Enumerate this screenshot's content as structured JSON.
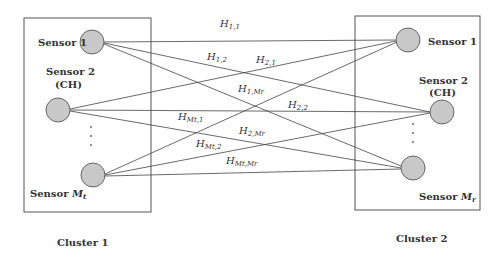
{
  "clusters": [
    {
      "label": "Cluster 1",
      "sensors": [
        {
          "name": "Sensor 1",
          "role": ""
        },
        {
          "name": "Sensor 2",
          "role": "(CH)"
        },
        {
          "name": "Sensor ",
          "index_symbol": "M",
          "index_sub": "t"
        }
      ]
    },
    {
      "label": "Cluster 2",
      "sensors": [
        {
          "name": "Sensor 1",
          "role": ""
        },
        {
          "name": "Sensor 2",
          "role": "(CH)"
        },
        {
          "name": "Sensor ",
          "index_symbol": "M",
          "index_sub": "r"
        }
      ]
    }
  ],
  "channels": [
    {
      "sym": "H",
      "sub": "1,1"
    },
    {
      "sym": "H",
      "sub": "1,2"
    },
    {
      "sym": "H",
      "sub": "2,1"
    },
    {
      "sym": "H",
      "sub": "1,Mr"
    },
    {
      "sym": "H",
      "sub": "2,2"
    },
    {
      "sym": "H",
      "sub": "Mt,1"
    },
    {
      "sym": "H",
      "sub": "2,Mr"
    },
    {
      "sym": "H",
      "sub": "Mt,2"
    },
    {
      "sym": "H",
      "sub": "Mt,Mr"
    }
  ],
  "ellipsis": "⋮"
}
